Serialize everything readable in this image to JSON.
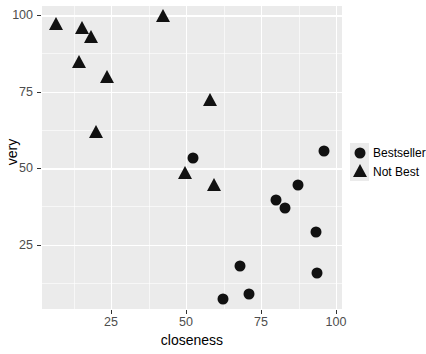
{
  "chart_data": {
    "type": "scatter",
    "title": "",
    "xlabel": "closeness",
    "ylabel": "very",
    "xlim": [
      2,
      102
    ],
    "ylim": [
      4,
      103
    ],
    "grid": true,
    "legend_position": "right",
    "x_ticks": [
      25,
      50,
      75,
      100
    ],
    "y_ticks": [
      25,
      50,
      75,
      100
    ],
    "x_tick_labels": [
      "25",
      "50",
      "75",
      "100"
    ],
    "y_tick_labels": [
      "25",
      "50",
      "75",
      "100"
    ],
    "x_minor_ticks": [
      12.5,
      37.5,
      62.5,
      87.5
    ],
    "y_minor_ticks": [
      12.5,
      37.5,
      62.5,
      87.5
    ],
    "series": [
      {
        "name": "Bestseller",
        "marker": "circle",
        "color": "#111111",
        "points": [
          {
            "x": 52.2,
            "y": 53.5
          },
          {
            "x": 95.9,
            "y": 55.6
          },
          {
            "x": 87.2,
            "y": 44.6
          },
          {
            "x": 80.1,
            "y": 39.7
          },
          {
            "x": 83.1,
            "y": 37.0
          },
          {
            "x": 93.2,
            "y": 29.1
          },
          {
            "x": 68.1,
            "y": 17.9
          },
          {
            "x": 93.8,
            "y": 15.8
          },
          {
            "x": 62.4,
            "y": 7.3
          },
          {
            "x": 71.1,
            "y": 8.9
          }
        ]
      },
      {
        "name": "Not Best",
        "marker": "triangle",
        "color": "#111111",
        "points": [
          {
            "x": 6.7,
            "y": 96.8
          },
          {
            "x": 15.4,
            "y": 95.5
          },
          {
            "x": 18.4,
            "y": 92.5
          },
          {
            "x": 14.3,
            "y": 84.3
          },
          {
            "x": 23.5,
            "y": 79.6
          },
          {
            "x": 42.2,
            "y": 99.4
          },
          {
            "x": 20.1,
            "y": 61.6
          },
          {
            "x": 49.8,
            "y": 48.0
          },
          {
            "x": 58.0,
            "y": 72.1
          },
          {
            "x": 59.3,
            "y": 44.3
          }
        ]
      }
    ]
  },
  "legend": {
    "entries": [
      {
        "label": "Bestseller",
        "marker": "circle"
      },
      {
        "label": "Not Best",
        "marker": "triangle"
      }
    ]
  },
  "colors": {
    "panel_background": "#ebebeb",
    "gridline": "#ffffff",
    "mark": "#111111",
    "tick_label": "#4d4d4d",
    "axis_title": "#000000",
    "page_background": "#ffffff"
  }
}
